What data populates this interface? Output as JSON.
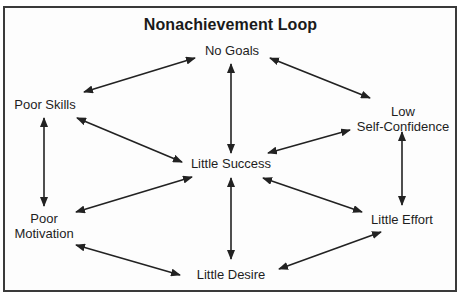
{
  "diagram": {
    "title": "Nonachievement Loop",
    "colors": {
      "border": "#3a3a3a",
      "arrow": "#222222",
      "text": "#1e1e1e",
      "background": "#ffffff"
    },
    "nodes": {
      "no_goals": {
        "label": "No Goals"
      },
      "poor_skills": {
        "label": "Poor Skills"
      },
      "low_self_confidence": {
        "line1": "Low",
        "line2": "Self-Confidence"
      },
      "little_success": {
        "label": "Little Success"
      },
      "poor_motivation": {
        "line1": "Poor",
        "line2": "Motivation"
      },
      "little_effort": {
        "label": "Little Effort"
      },
      "little_desire": {
        "label": "Little Desire"
      }
    },
    "edges": [
      {
        "from": "No Goals",
        "to": "Poor Skills",
        "type": "bidirectional"
      },
      {
        "from": "No Goals",
        "to": "Low Self-Confidence",
        "type": "bidirectional"
      },
      {
        "from": "No Goals",
        "to": "Little Success",
        "type": "bidirectional"
      },
      {
        "from": "Poor Skills",
        "to": "Little Success",
        "type": "bidirectional"
      },
      {
        "from": "Poor Skills",
        "to": "Poor Motivation",
        "type": "bidirectional"
      },
      {
        "from": "Low Self-Confidence",
        "to": "Little Success",
        "type": "bidirectional"
      },
      {
        "from": "Low Self-Confidence",
        "to": "Little Effort",
        "type": "bidirectional"
      },
      {
        "from": "Poor Motivation",
        "to": "Little Success",
        "type": "bidirectional"
      },
      {
        "from": "Little Success",
        "to": "Little Effort",
        "type": "bidirectional"
      },
      {
        "from": "Little Success",
        "to": "Little Desire",
        "type": "bidirectional"
      },
      {
        "from": "Poor Motivation",
        "to": "Little Desire",
        "type": "bidirectional"
      },
      {
        "from": "Little Desire",
        "to": "Little Effort",
        "type": "bidirectional"
      }
    ]
  }
}
